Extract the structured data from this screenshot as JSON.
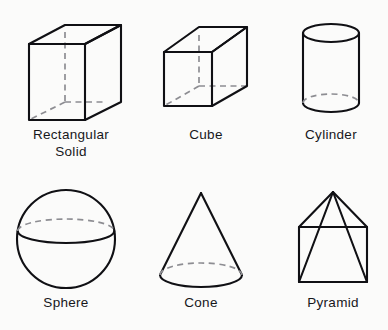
{
  "page": {
    "background_color": "#fbfbfa",
    "ink_color": "#101014",
    "hidden_edge_color": "#8d8d92"
  },
  "figures": [
    {
      "name": "rectangular-solid",
      "label": "Rectangular\nSolid",
      "shape": "rectangular solid",
      "hidden_edges": "back vertical edge and two back base edges shown dashed"
    },
    {
      "name": "cube",
      "label": "Cube",
      "shape": "cube",
      "hidden_edges": "back vertical edge and two back base edges shown dashed"
    },
    {
      "name": "cylinder",
      "label": "Cylinder",
      "shape": "cylinder",
      "hidden_edges": "rear half of bottom base ellipse shown dashed"
    },
    {
      "name": "sphere",
      "label": "Sphere",
      "shape": "sphere",
      "hidden_edges": "rear half of equator ellipse shown dashed"
    },
    {
      "name": "cone",
      "label": "Cone",
      "shape": "cone",
      "hidden_edges": "rear half of base ellipse shown dashed"
    },
    {
      "name": "pyramid",
      "label": "Pyramid",
      "shape": "square pyramid",
      "hidden_edges": "rear base edge and rear lateral edge shown dashed"
    }
  ]
}
